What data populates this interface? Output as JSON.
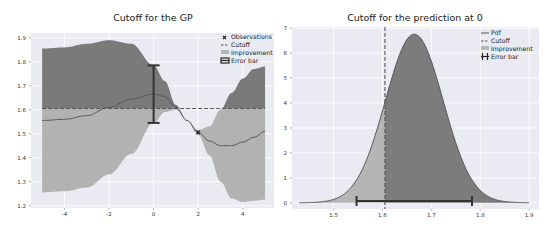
{
  "colors": {
    "plot_bg": "#eaeaf2",
    "grid": "#ffffff",
    "band_upper": "#7a7a7a",
    "band_lower": "#b2b2b2",
    "improvement_dark": "#7c7c7c",
    "improvement_light": "#b5b5b5",
    "mean_line": "#555555",
    "cutoff": "#555555",
    "errorbar": "#333333"
  },
  "chart_data": [
    {
      "type": "area",
      "title": "Cutoff for the GP",
      "xlabel": "",
      "ylabel": "",
      "xlim": [
        -5.5,
        5.4
      ],
      "ylim": [
        1.19,
        1.92
      ],
      "grid": true,
      "legend_position": "upper right",
      "x_ticks": [
        -4,
        -2,
        0,
        2,
        4
      ],
      "y_ticks": [
        1.2,
        1.3,
        1.4,
        1.5,
        1.6,
        1.7,
        1.8,
        1.9
      ],
      "x_tick_labels": [
        "-4",
        "-2",
        "0",
        "2",
        "4"
      ],
      "y_tick_labels": [
        "1.2",
        "1.3",
        "1.4",
        "1.5",
        "1.6",
        "1.7",
        "1.8",
        "1.9"
      ],
      "x": [
        -5,
        -4,
        -3,
        -2,
        -1,
        0,
        0.5,
        1,
        1.5,
        2,
        2.5,
        3,
        3.5,
        4,
        4.5,
        5
      ],
      "series": [
        {
          "name": "mean",
          "values": [
            1.555,
            1.56,
            1.575,
            1.61,
            1.645,
            1.665,
            1.655,
            1.61,
            1.555,
            1.505,
            1.47,
            1.45,
            1.45,
            1.465,
            1.485,
            1.51
          ]
        },
        {
          "name": "upper",
          "values": [
            1.855,
            1.86,
            1.875,
            1.89,
            1.875,
            1.785,
            1.72,
            1.62,
            1.555,
            1.515,
            1.53,
            1.6,
            1.67,
            1.73,
            1.77,
            1.78
          ]
        },
        {
          "name": "lower",
          "values": [
            1.255,
            1.26,
            1.275,
            1.33,
            1.415,
            1.545,
            1.59,
            1.6,
            1.555,
            1.495,
            1.41,
            1.3,
            1.23,
            1.215,
            1.22,
            1.225
          ]
        }
      ],
      "cutoff": 1.605,
      "observations": [
        {
          "x": 2,
          "y": 1.505
        }
      ],
      "error_bar": {
        "x": 0,
        "low": 1.545,
        "high": 1.785
      },
      "legend": [
        "Observations",
        "Cutoff",
        "Improvement",
        "Error bar"
      ]
    },
    {
      "type": "area",
      "title": "Cutoff for the prediction at 0",
      "xlabel": "",
      "ylabel": "",
      "xlim": [
        1.415,
        1.92
      ],
      "ylim": [
        -0.25,
        7.05
      ],
      "grid": true,
      "legend_position": "upper right",
      "x_ticks": [
        1.5,
        1.6,
        1.7,
        1.8,
        1.9
      ],
      "y_ticks": [
        0,
        1,
        2,
        3,
        4,
        5,
        6,
        7
      ],
      "x_tick_labels": [
        "1.5",
        "1.6",
        "1.7",
        "1.8",
        "1.9"
      ],
      "y_tick_labels": [
        "0",
        "1",
        "2",
        "3",
        "4",
        "5",
        "6",
        "7"
      ],
      "pdf": {
        "mean": 1.665,
        "std": 0.059,
        "x_range": [
          1.43,
          1.9
        ],
        "peak": 6.75
      },
      "cutoff": 1.605,
      "error_bar": {
        "y": 0.07,
        "low": 1.547,
        "high": 1.783
      },
      "legend": [
        "Pdf",
        "Cutoff",
        "Improvement",
        "Error bar"
      ]
    }
  ]
}
